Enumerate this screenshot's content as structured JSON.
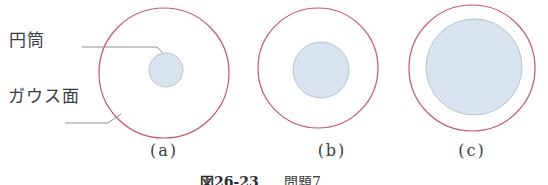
{
  "figure": {
    "type": "diagram",
    "labels": {
      "cylinder": "円筒",
      "gauss_surface": "ガウス面"
    },
    "panels": [
      {
        "id": "a",
        "label": "(a)"
      },
      {
        "id": "b",
        "label": "(b)"
      },
      {
        "id": "c",
        "label": "(c)"
      }
    ],
    "caption": {
      "number": "図26-23",
      "title": "問題7"
    },
    "colors": {
      "background": "#ffffff",
      "gauss_circle_stroke": "#c3596b",
      "cylinder_fill": "#dbe6f1",
      "cylinder_dot": "#ccdae8",
      "cylinder_stroke": "#b4c4d3",
      "leader_line": "#8b9095",
      "text": "#3c3c3e"
    },
    "geometry": {
      "leaders": [
        {
          "name": "cylinder-leader-line",
          "points": "82,47 157,47 164,54"
        },
        {
          "name": "gauss-surface-leader-line",
          "points": "65,123 108,123 121,114"
        }
      ],
      "panels": [
        {
          "id": "a",
          "gauss": {
            "cx": 164,
            "cy": 73,
            "r": 65
          },
          "cylinder": {
            "cx": 166,
            "cy": 70,
            "r": 17
          }
        },
        {
          "id": "b",
          "gauss": {
            "cx": 318,
            "cy": 68,
            "r": 60
          },
          "cylinder": {
            "cx": 321,
            "cy": 70,
            "r": 28
          }
        },
        {
          "id": "c",
          "gauss": {
            "cx": 472,
            "cy": 68,
            "r": 63
          },
          "cylinder": {
            "cx": 474,
            "cy": 67,
            "r": 48
          }
        }
      ]
    }
  }
}
